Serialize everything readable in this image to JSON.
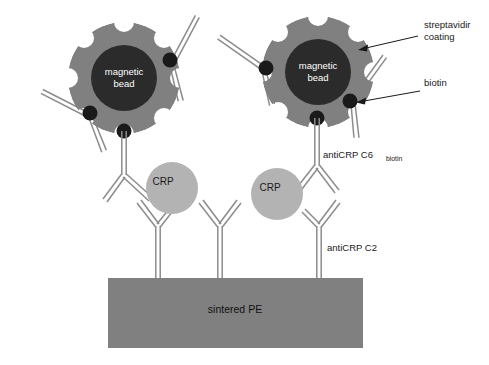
{
  "figure": {
    "type": "scientific-schematic",
    "background_color": "#ffffff"
  },
  "colors": {
    "bead_core": "#2b2b2b",
    "streptavidin_coating": "#808080",
    "biotin_dot": "#1a1a1a",
    "crp_fill": "#b3b3b3",
    "substrate_fill": "#808080",
    "antibody_stroke": "#8c8c8c",
    "notch_fill": "#ffffff",
    "annotation_text": "#1a1a1a",
    "leader_line": "#1a1a1a"
  },
  "beads": [
    {
      "id": "bead-left",
      "core_label": "magnetic",
      "core_label_2": "bead",
      "cx": 124,
      "cy": 78,
      "coating_r": 56,
      "core_r": 33
    },
    {
      "id": "bead-right",
      "core_label": "magnetic",
      "core_label_2": "bead",
      "cx": 318,
      "cy": 72,
      "coating_r": 56,
      "core_r": 33
    }
  ],
  "analytes": [
    {
      "id": "crp-left",
      "label": "CRP",
      "cx": 172,
      "cy": 188,
      "r": 26
    },
    {
      "id": "crp-right",
      "label": "CRP",
      "cx": 277,
      "cy": 194,
      "r": 26
    }
  ],
  "substrate": {
    "label": "sintered PE",
    "x": 108,
    "y": 278,
    "width": 255,
    "height": 70
  },
  "annotations": [
    {
      "id": "streptavidin",
      "line1": "streptavidir",
      "line2": "coating",
      "text_x": 424,
      "text_y": 33,
      "leader": {
        "x1": 418,
        "y1": 36,
        "x2": 360,
        "y2": 48
      },
      "arrow_at": {
        "x": 360,
        "y": 48
      }
    },
    {
      "id": "biotin",
      "line1": "biotin",
      "line2": "",
      "text_x": 424,
      "text_y": 88,
      "leader": {
        "x1": 420,
        "y1": 91,
        "x2": 356,
        "y2": 101
      },
      "arrow_at": {
        "x": 356,
        "y": 101
      }
    },
    {
      "id": "anticrp-c6",
      "line1": "antiCRP C6",
      "subscript": "biotin",
      "text_x": 323,
      "text_y": 155
    },
    {
      "id": "anticrp-c2",
      "line1": "antiCRP C2",
      "subscript": "",
      "text_x": 323,
      "text_y": 250
    }
  ],
  "antibodies": [
    {
      "id": "ab-left-bead-west",
      "role": "detection",
      "anchor": "bead-left"
    },
    {
      "id": "ab-left-bead-east",
      "role": "detection",
      "anchor": "bead-left"
    },
    {
      "id": "ab-left-bead-south",
      "role": "detection",
      "anchor": "bead-left"
    },
    {
      "id": "ab-right-bead-west",
      "role": "detection",
      "anchor": "bead-right"
    },
    {
      "id": "ab-right-bead-east",
      "role": "detection",
      "anchor": "bead-right"
    },
    {
      "id": "ab-right-bead-south",
      "role": "detection",
      "anchor": "bead-right"
    },
    {
      "id": "ab-capture-left",
      "role": "capture",
      "anchor": "substrate"
    },
    {
      "id": "ab-capture-middle",
      "role": "capture",
      "anchor": "substrate"
    },
    {
      "id": "ab-capture-right",
      "role": "capture",
      "anchor": "substrate"
    }
  ]
}
